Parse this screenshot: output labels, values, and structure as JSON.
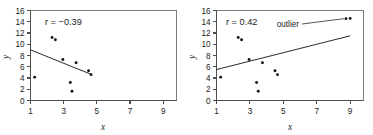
{
  "figure": {
    "panel_count": 2
  },
  "chart_data": [
    {
      "type": "scatter",
      "title": "",
      "panel_label": "left",
      "xlabel": "x",
      "ylabel": "y",
      "xlim": [
        1,
        9.8
      ],
      "ylim": [
        0,
        16
      ],
      "xticks": [
        1,
        3,
        5,
        7,
        9
      ],
      "yticks": [
        0,
        2,
        4,
        6,
        8,
        10,
        12,
        14,
        16
      ],
      "xticklabels": [
        "1",
        "3",
        "5",
        "7",
        "9"
      ],
      "yticklabels": [
        "0",
        "2",
        "4",
        "6",
        "8",
        "10",
        "12",
        "14",
        "16"
      ],
      "grid": false,
      "legend": null,
      "annotations": [
        {
          "name": "correlation",
          "text": "r = −0.39",
          "r_value": -0.39,
          "x": 2.0,
          "y": 14.2
        }
      ],
      "points": [
        {
          "x": 1.25,
          "y": 4.15
        },
        {
          "x": 2.3,
          "y": 11.2
        },
        {
          "x": 2.5,
          "y": 10.8
        },
        {
          "x": 2.95,
          "y": 7.3
        },
        {
          "x": 3.4,
          "y": 3.2
        },
        {
          "x": 3.5,
          "y": 1.65
        },
        {
          "x": 3.75,
          "y": 6.7
        },
        {
          "x": 4.5,
          "y": 5.3
        },
        {
          "x": 4.65,
          "y": 4.6
        }
      ],
      "trendline": {
        "x0": 1.0,
        "y0": 9.0,
        "x1": 4.7,
        "y1": 4.6
      }
    },
    {
      "type": "scatter",
      "title": "",
      "panel_label": "right",
      "xlabel": "x",
      "ylabel": "y",
      "xlim": [
        1,
        9.8
      ],
      "ylim": [
        0,
        16
      ],
      "xticks": [
        1,
        3,
        5,
        7,
        9
      ],
      "yticks": [
        0,
        2,
        4,
        6,
        8,
        10,
        12,
        14,
        16
      ],
      "xticklabels": [
        "1",
        "3",
        "5",
        "7",
        "9"
      ],
      "yticklabels": [
        "0",
        "2",
        "4",
        "6",
        "8",
        "10",
        "12",
        "14",
        "16"
      ],
      "grid": false,
      "legend": null,
      "annotations": [
        {
          "name": "correlation",
          "text": "r = 0.42",
          "r_value": 0.42,
          "x": 2.0,
          "y": 14.2
        },
        {
          "name": "outlier",
          "text": "outlier",
          "x": 6.4,
          "y": 14.5
        }
      ],
      "points": [
        {
          "x": 1.25,
          "y": 4.15
        },
        {
          "x": 2.3,
          "y": 11.2
        },
        {
          "x": 2.5,
          "y": 10.8
        },
        {
          "x": 2.95,
          "y": 7.3
        },
        {
          "x": 3.4,
          "y": 3.2
        },
        {
          "x": 3.5,
          "y": 1.65
        },
        {
          "x": 3.75,
          "y": 6.7
        },
        {
          "x": 4.5,
          "y": 5.3
        },
        {
          "x": 4.65,
          "y": 4.6
        },
        {
          "x": 8.75,
          "y": 14.55
        },
        {
          "x": 9.0,
          "y": 14.6
        }
      ],
      "outlier_points": [
        {
          "x": 8.75,
          "y": 14.55
        },
        {
          "x": 9.0,
          "y": 14.6
        }
      ],
      "trendline": {
        "x0": 1.0,
        "y0": 5.5,
        "x1": 9.0,
        "y1": 11.5
      }
    }
  ],
  "colors": {
    "point": "#151515",
    "line": "#2a2a2a",
    "axis": "#4f4f4f",
    "frame": "#6d6d6d",
    "text": "#1a1a1a",
    "background": "#ffffff"
  }
}
